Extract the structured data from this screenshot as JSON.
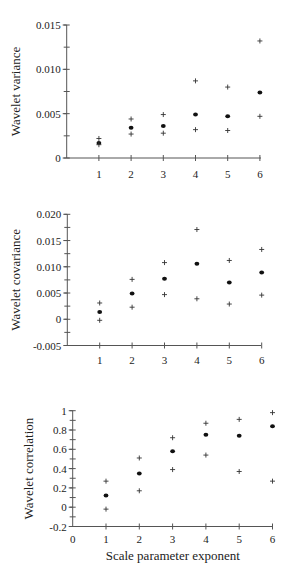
{
  "figure": {
    "panels": [
      {
        "id": "variance",
        "ylabel": "Wavelet variance",
        "xlabel": ""
      },
      {
        "id": "covariance",
        "ylabel": "Wavelet covariance",
        "xlabel": ""
      },
      {
        "id": "correlation",
        "ylabel": "Wavelet correlation",
        "xlabel": "Scale parameter exponent"
      }
    ]
  },
  "chart_data": [
    {
      "type": "scatter",
      "title": "",
      "xlabel": "",
      "ylabel": "Wavelet variance",
      "x": [
        1,
        2,
        3,
        4,
        5,
        6
      ],
      "xticks": [
        "1",
        "2",
        "3",
        "4",
        "5",
        "6"
      ],
      "ylim": [
        0,
        0.015
      ],
      "yticks": [
        "0",
        "0.005",
        "0.010",
        "0.015"
      ],
      "ytick_values": [
        0,
        0.005,
        0.01,
        0.015
      ],
      "yminor_step": 0.0025,
      "grid": false,
      "series": [
        {
          "name": "estimate",
          "marker": "dot",
          "values": [
            0.0017,
            0.0034,
            0.0036,
            0.0049,
            0.0047,
            0.0074
          ]
        },
        {
          "name": "upper bound",
          "marker": "plus",
          "values": [
            0.0022,
            0.0044,
            0.0049,
            0.0087,
            0.008,
            0.0132
          ]
        },
        {
          "name": "lower bound",
          "marker": "plus",
          "values": [
            0.0015,
            0.0027,
            0.0028,
            0.0032,
            0.0031,
            0.0047
          ]
        }
      ]
    },
    {
      "type": "scatter",
      "title": "",
      "xlabel": "",
      "ylabel": "Wavelet covariance",
      "x": [
        1,
        2,
        3,
        4,
        5,
        6
      ],
      "xticks": [
        "1",
        "2",
        "3",
        "4",
        "5",
        "6"
      ],
      "ylim": [
        -0.005,
        0.02
      ],
      "yticks": [
        "-0.005",
        "0",
        "0.005",
        "0.010",
        "0.015",
        "0.020"
      ],
      "ytick_values": [
        -0.005,
        0,
        0.005,
        0.01,
        0.015,
        0.02
      ],
      "yminor_step": 0.0025,
      "grid": false,
      "series": [
        {
          "name": "estimate",
          "marker": "dot",
          "values": [
            0.0014,
            0.0049,
            0.0077,
            0.0106,
            0.007,
            0.0089
          ]
        },
        {
          "name": "upper bound",
          "marker": "plus",
          "values": [
            0.0031,
            0.0076,
            0.0108,
            0.0171,
            0.0112,
            0.0133
          ]
        },
        {
          "name": "lower bound",
          "marker": "plus",
          "values": [
            -0.0002,
            0.0023,
            0.0047,
            0.0039,
            0.0029,
            0.0046
          ]
        }
      ]
    },
    {
      "type": "scatter",
      "title": "",
      "xlabel": "Scale parameter exponent",
      "ylabel": "Wavelet correlation",
      "x": [
        1,
        2,
        3,
        4,
        5,
        6
      ],
      "xticks": [
        "0",
        "1",
        "2",
        "3",
        "4",
        "5",
        "6"
      ],
      "xlim": [
        0,
        6
      ],
      "ylim": [
        -0.2,
        1
      ],
      "yticks": [
        "-0.2",
        "0",
        "0.2",
        "0.4",
        "0.6",
        "0.8",
        "1"
      ],
      "ytick_values": [
        -0.2,
        0,
        0.2,
        0.4,
        0.6,
        0.8,
        1
      ],
      "yminor_step": 0.1,
      "grid": false,
      "series": [
        {
          "name": "estimate",
          "marker": "dot",
          "values": [
            0.12,
            0.35,
            0.58,
            0.75,
            0.74,
            0.84
          ]
        },
        {
          "name": "upper bound",
          "marker": "plus",
          "values": [
            0.27,
            0.51,
            0.72,
            0.87,
            0.91,
            0.98
          ]
        },
        {
          "name": "lower bound",
          "marker": "plus",
          "values": [
            -0.02,
            0.17,
            0.39,
            0.54,
            0.37,
            0.27
          ]
        }
      ]
    }
  ]
}
